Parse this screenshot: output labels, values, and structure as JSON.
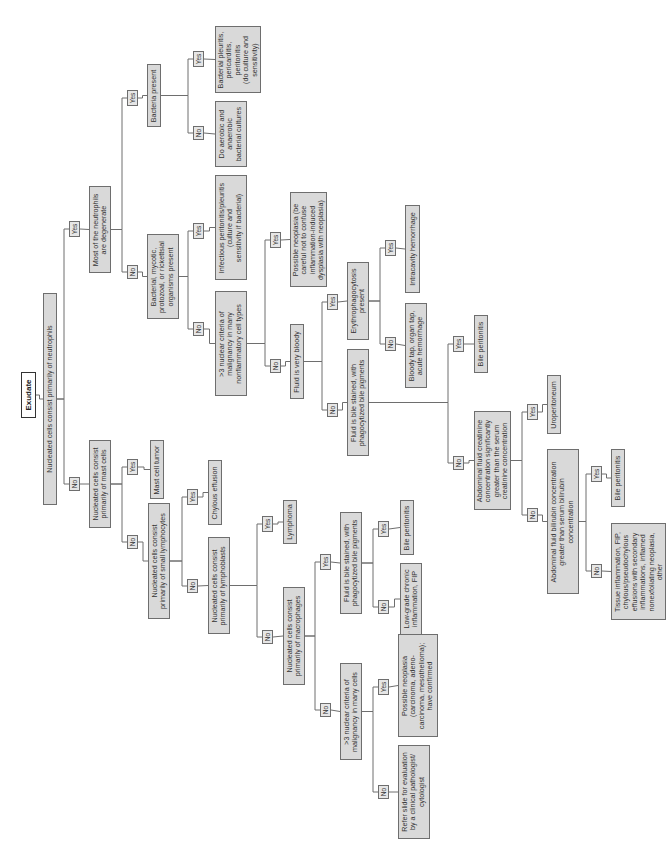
{
  "diagram": {
    "title": "Exudate",
    "orientation": "rotated -90deg (text reads bottom-to-top)",
    "line_color": "#6e6e6e",
    "box_fill": "#d9d9d9",
    "nodes": [
      {
        "id": "exudate",
        "kind": "root",
        "text": "Exudate",
        "x": 21,
        "y": 372,
        "w": 15,
        "h": 46
      },
      {
        "id": "neutrophils",
        "kind": "q",
        "text": "Nucleated cells consist primarily of neutrophils",
        "x": 43,
        "y": 293,
        "w": 14,
        "h": 212
      },
      {
        "id": "y_neut",
        "kind": "lbl",
        "text": "Yes",
        "x": 69,
        "y": 221,
        "w": 11,
        "h": 16
      },
      {
        "id": "degenerate",
        "kind": "q",
        "text": "Most of the neutrophils\nare degenerate",
        "x": 89,
        "y": 186,
        "w": 22,
        "h": 87
      },
      {
        "id": "y_degen",
        "kind": "lbl",
        "text": "Yes",
        "x": 127,
        "y": 90,
        "w": 11,
        "h": 16
      },
      {
        "id": "bacteria",
        "kind": "q",
        "text": "Bacteria present",
        "x": 147,
        "y": 64,
        "w": 14,
        "h": 63
      },
      {
        "id": "y_bact",
        "kind": "lbl",
        "text": "Yes",
        "x": 193,
        "y": 51,
        "w": 11,
        "h": 16
      },
      {
        "id": "bact_pleuritis",
        "kind": "r",
        "text": "Bacterial pleuritis,\npericarditis,\nperitonitis\n(do culture and\nsensitivity)",
        "x": 215,
        "y": 26,
        "w": 46,
        "h": 67
      },
      {
        "id": "n_bact",
        "kind": "lbl",
        "text": "No",
        "x": 193,
        "y": 126,
        "w": 11,
        "h": 14
      },
      {
        "id": "aerobic",
        "kind": "r",
        "text": "Do aerobic and\nanaerobic\nbacterial cultures",
        "x": 215,
        "y": 101,
        "w": 32,
        "h": 66
      },
      {
        "id": "n_degen",
        "kind": "lbl",
        "text": "No",
        "x": 127,
        "y": 265,
        "w": 11,
        "h": 14
      },
      {
        "id": "organisms",
        "kind": "q",
        "text": "Bacterial, mycotic,\nprotozoal, or rickettsial\norganisms present",
        "x": 147,
        "y": 234,
        "w": 32,
        "h": 85
      },
      {
        "id": "y_org",
        "kind": "lbl",
        "text": "Yes",
        "x": 193,
        "y": 223,
        "w": 11,
        "h": 16
      },
      {
        "id": "infectious",
        "kind": "r",
        "text": "Infectious peritonitis/pleuritis\n(culture and\nsensitivity if bacterial)",
        "x": 215,
        "y": 175,
        "w": 32,
        "h": 105
      },
      {
        "id": "n_org",
        "kind": "lbl",
        "text": "No",
        "x": 193,
        "y": 322,
        "w": 11,
        "h": 14
      },
      {
        "id": "malig_nonfl",
        "kind": "q",
        "text": ">3 nuclear criteria of\nmalignancy in many\nnonflammatory cell types",
        "x": 215,
        "y": 291,
        "w": 32,
        "h": 105
      },
      {
        "id": "y_malig1",
        "kind": "lbl",
        "text": "Yes",
        "x": 270,
        "y": 232,
        "w": 11,
        "h": 16
      },
      {
        "id": "poss_neo1",
        "kind": "r",
        "text": "Possible neoplasia (be\ncareful not to confuse\ninflammation-induced\ndysplasia with neoplasia)",
        "x": 290,
        "y": 192,
        "w": 37,
        "h": 95
      },
      {
        "id": "n_malig1",
        "kind": "lbl",
        "text": "No",
        "x": 270,
        "y": 359,
        "w": 11,
        "h": 14
      },
      {
        "id": "bloody",
        "kind": "q",
        "text": "Fluid is very bloody",
        "x": 290,
        "y": 324,
        "w": 14,
        "h": 75
      },
      {
        "id": "y_bloody",
        "kind": "lbl",
        "text": "Yes",
        "x": 327,
        "y": 294,
        "w": 11,
        "h": 16
      },
      {
        "id": "erythro",
        "kind": "q",
        "text": "Erythrophagocytosis\npresent",
        "x": 347,
        "y": 262,
        "w": 22,
        "h": 78
      },
      {
        "id": "y_erythro",
        "kind": "lbl",
        "text": "Yes",
        "x": 385,
        "y": 240,
        "w": 11,
        "h": 16
      },
      {
        "id": "intracavity",
        "kind": "r",
        "text": "Intracavity hemorrhage",
        "x": 405,
        "y": 205,
        "w": 15,
        "h": 88
      },
      {
        "id": "n_erythro",
        "kind": "lbl",
        "text": "No",
        "x": 385,
        "y": 337,
        "w": 11,
        "h": 14
      },
      {
        "id": "bloody_tap",
        "kind": "r",
        "text": "Bloody tap, organ tap,\nacute hemorrhage",
        "x": 405,
        "y": 303,
        "w": 22,
        "h": 85
      },
      {
        "id": "n_bloody",
        "kind": "lbl",
        "text": "No",
        "x": 327,
        "y": 403,
        "w": 11,
        "h": 14
      },
      {
        "id": "bile_stained1",
        "kind": "q",
        "text": "Fluid is bile stained, with\nphagocytized bile pigments",
        "x": 347,
        "y": 349,
        "w": 22,
        "h": 107
      },
      {
        "id": "y_bile1",
        "kind": "lbl",
        "text": "Yes",
        "x": 453,
        "y": 336,
        "w": 11,
        "h": 16
      },
      {
        "id": "bile_perit1",
        "kind": "r",
        "text": "Bile peritonitis",
        "x": 474,
        "y": 315,
        "w": 14,
        "h": 58
      },
      {
        "id": "n_bile1",
        "kind": "lbl",
        "text": "No",
        "x": 453,
        "y": 456,
        "w": 11,
        "h": 14
      },
      {
        "id": "creatinine",
        "kind": "q",
        "text": "Abdominal fluid creatinine\nconcentration significantly\ngreater than the serum\ncreatinine concentration",
        "x": 474,
        "y": 411,
        "w": 37,
        "h": 99
      },
      {
        "id": "y_creat",
        "kind": "lbl",
        "text": "Yes",
        "x": 527,
        "y": 404,
        "w": 11,
        "h": 16
      },
      {
        "id": "uroperit",
        "kind": "r",
        "text": "Uroperitoneum",
        "x": 547,
        "y": 375,
        "w": 14,
        "h": 59
      },
      {
        "id": "n_creat",
        "kind": "lbl",
        "text": "No",
        "x": 527,
        "y": 508,
        "w": 11,
        "h": 14
      },
      {
        "id": "bilirubin",
        "kind": "q",
        "text": "Abdominal fluid bilirubin concentration\ngreater than serum bilirubin\nconcentration",
        "x": 547,
        "y": 449,
        "w": 32,
        "h": 145
      },
      {
        "id": "y_bili",
        "kind": "lbl",
        "text": "Yes",
        "x": 591,
        "y": 466,
        "w": 11,
        "h": 16
      },
      {
        "id": "bile_perit2",
        "kind": "r",
        "text": "Bile peritonitis",
        "x": 611,
        "y": 449,
        "w": 14,
        "h": 58
      },
      {
        "id": "n_bili",
        "kind": "lbl",
        "text": "No",
        "x": 591,
        "y": 564,
        "w": 11,
        "h": 14
      },
      {
        "id": "tissue",
        "kind": "r",
        "text": "Tissue inflammation, FIP,\nchylous/pseudochylous\neffusions with secondary\ninflammations, inflamed\nnonexfoliating neoplasia,\nother",
        "x": 611,
        "y": 523,
        "w": 55,
        "h": 97
      },
      {
        "id": "n_neut",
        "kind": "lbl",
        "text": "No",
        "x": 69,
        "y": 477,
        "w": 11,
        "h": 14
      },
      {
        "id": "mast",
        "kind": "q",
        "text": "Nucleated cells consist\nprimarily of mast cells",
        "x": 89,
        "y": 440,
        "w": 22,
        "h": 88
      },
      {
        "id": "y_mast",
        "kind": "lbl",
        "text": "Yes",
        "x": 127,
        "y": 459,
        "w": 11,
        "h": 16
      },
      {
        "id": "mast_tumor",
        "kind": "r",
        "text": "Mast cell tumor",
        "x": 150,
        "y": 440,
        "w": 14,
        "h": 59
      },
      {
        "id": "n_mast",
        "kind": "lbl",
        "text": "No",
        "x": 127,
        "y": 535,
        "w": 11,
        "h": 14
      },
      {
        "id": "small_lymph",
        "kind": "q",
        "text": "Nucleated cells consist\nprimarily of small lymphocytes",
        "x": 148,
        "y": 503,
        "w": 22,
        "h": 116
      },
      {
        "id": "y_small",
        "kind": "lbl",
        "text": "Yes",
        "x": 187,
        "y": 489,
        "w": 11,
        "h": 16
      },
      {
        "id": "chylous",
        "kind": "r",
        "text": "Chylous effusion",
        "x": 208,
        "y": 460,
        "w": 14,
        "h": 65
      },
      {
        "id": "n_small",
        "kind": "lbl",
        "text": "No",
        "x": 187,
        "y": 579,
        "w": 11,
        "h": 14
      },
      {
        "id": "lymphoblasts",
        "kind": "q",
        "text": "Nucleated cells consist\nprimarily of lymphoblasts",
        "x": 208,
        "y": 537,
        "w": 22,
        "h": 97
      },
      {
        "id": "y_lymphob",
        "kind": "lbl",
        "text": "Yes",
        "x": 262,
        "y": 516,
        "w": 11,
        "h": 16
      },
      {
        "id": "lymphoma",
        "kind": "r",
        "text": "Lymphoma",
        "x": 283,
        "y": 500,
        "w": 14,
        "h": 44
      },
      {
        "id": "n_lymphob",
        "kind": "lbl",
        "text": "No",
        "x": 262,
        "y": 630,
        "w": 11,
        "h": 14
      },
      {
        "id": "macrophages",
        "kind": "q",
        "text": "Nucleated cells consist\nprimarily of macrophages",
        "x": 283,
        "y": 587,
        "w": 22,
        "h": 98
      },
      {
        "id": "y_macro",
        "kind": "lbl",
        "text": "Yes",
        "x": 320,
        "y": 554,
        "w": 11,
        "h": 16
      },
      {
        "id": "bile_stained2",
        "kind": "q",
        "text": "Fluid is bile stained, with\nphagocytized bile pigments",
        "x": 340,
        "y": 512,
        "w": 22,
        "h": 102
      },
      {
        "id": "y_bile2",
        "kind": "lbl",
        "text": "Yes",
        "x": 378,
        "y": 521,
        "w": 11,
        "h": 16
      },
      {
        "id": "bile_perit3",
        "kind": "r",
        "text": "Bile peritonitis",
        "x": 400,
        "y": 500,
        "w": 14,
        "h": 55
      },
      {
        "id": "n_bile2",
        "kind": "lbl",
        "text": "No",
        "x": 378,
        "y": 600,
        "w": 11,
        "h": 14
      },
      {
        "id": "lowgrade",
        "kind": "r",
        "text": "Low-grade chronic\ninflammation, FIP",
        "x": 400,
        "y": 563,
        "w": 22,
        "h": 72
      },
      {
        "id": "n_macro",
        "kind": "lbl",
        "text": "No",
        "x": 320,
        "y": 703,
        "w": 11,
        "h": 14
      },
      {
        "id": "malig_many",
        "kind": "q",
        "text": ">3 nuclear criteria of\nmalignancy in many cells",
        "x": 340,
        "y": 663,
        "w": 22,
        "h": 97
      },
      {
        "id": "y_malig2",
        "kind": "lbl",
        "text": "Yes",
        "x": 378,
        "y": 679,
        "w": 11,
        "h": 16
      },
      {
        "id": "poss_neo2",
        "kind": "r",
        "text": "Possible neoplasia\n(carcinoma, adeno-\ncarcinoma, mesothelioma);\nhave confirmed",
        "x": 398,
        "y": 634,
        "w": 40,
        "h": 103
      },
      {
        "id": "n_malig2",
        "kind": "lbl",
        "text": "No",
        "x": 378,
        "y": 785,
        "w": 11,
        "h": 14
      },
      {
        "id": "refer",
        "kind": "r",
        "text": "Refer slide for evaluation\nby a clinical pathologist/\ncytologist",
        "x": 398,
        "y": 745,
        "w": 32,
        "h": 94
      }
    ],
    "edges": [
      [
        "exudate",
        "neutrophils"
      ],
      [
        "neutrophils",
        "y_neut"
      ],
      [
        "y_neut",
        "degenerate"
      ],
      [
        "degenerate",
        "y_degen"
      ],
      [
        "y_degen",
        "bacteria"
      ],
      [
        "bacteria",
        "y_bact"
      ],
      [
        "y_bact",
        "bact_pleuritis"
      ],
      [
        "bacteria",
        "n_bact"
      ],
      [
        "n_bact",
        "aerobic"
      ],
      [
        "degenerate",
        "n_degen"
      ],
      [
        "n_degen",
        "organisms"
      ],
      [
        "organisms",
        "y_org"
      ],
      [
        "y_org",
        "infectious"
      ],
      [
        "organisms",
        "n_org"
      ],
      [
        "n_org",
        "malig_nonfl"
      ],
      [
        "malig_nonfl",
        "y_malig1"
      ],
      [
        "y_malig1",
        "poss_neo1"
      ],
      [
        "malig_nonfl",
        "n_malig1"
      ],
      [
        "n_malig1",
        "bloody"
      ],
      [
        "bloody",
        "y_bloody"
      ],
      [
        "y_bloody",
        "erythro"
      ],
      [
        "erythro",
        "y_erythro"
      ],
      [
        "y_erythro",
        "intracavity"
      ],
      [
        "erythro",
        "n_erythro"
      ],
      [
        "n_erythro",
        "bloody_tap"
      ],
      [
        "bloody",
        "n_bloody"
      ],
      [
        "n_bloody",
        "bile_stained1"
      ],
      [
        "bile_stained1",
        "y_bile1"
      ],
      [
        "y_bile1",
        "bile_perit1"
      ],
      [
        "bile_stained1",
        "n_bile1"
      ],
      [
        "n_bile1",
        "creatinine"
      ],
      [
        "creatinine",
        "y_creat"
      ],
      [
        "y_creat",
        "uroperit"
      ],
      [
        "creatinine",
        "n_creat"
      ],
      [
        "n_creat",
        "bilirubin"
      ],
      [
        "bilirubin",
        "y_bili"
      ],
      [
        "y_bili",
        "bile_perit2"
      ],
      [
        "bilirubin",
        "n_bili"
      ],
      [
        "n_bili",
        "tissue"
      ],
      [
        "neutrophils",
        "n_neut"
      ],
      [
        "n_neut",
        "mast"
      ],
      [
        "mast",
        "y_mast"
      ],
      [
        "y_mast",
        "mast_tumor"
      ],
      [
        "mast",
        "n_mast"
      ],
      [
        "n_mast",
        "small_lymph"
      ],
      [
        "small_lymph",
        "y_small"
      ],
      [
        "y_small",
        "chylous"
      ],
      [
        "small_lymph",
        "n_small"
      ],
      [
        "n_small",
        "lymphoblasts"
      ],
      [
        "lymphoblasts",
        "y_lymphob"
      ],
      [
        "y_lymphob",
        "lymphoma"
      ],
      [
        "lymphoblasts",
        "n_lymphob"
      ],
      [
        "n_lymphob",
        "macrophages"
      ],
      [
        "macrophages",
        "y_macro"
      ],
      [
        "y_macro",
        "bile_stained2"
      ],
      [
        "bile_stained2",
        "y_bile2"
      ],
      [
        "y_bile2",
        "bile_perit3"
      ],
      [
        "bile_stained2",
        "n_bile2"
      ],
      [
        "n_bile2",
        "lowgrade"
      ],
      [
        "macrophages",
        "n_macro"
      ],
      [
        "n_macro",
        "malig_many"
      ],
      [
        "malig_many",
        "y_malig2"
      ],
      [
        "y_malig2",
        "poss_neo2"
      ],
      [
        "malig_many",
        "n_malig2"
      ],
      [
        "n_malig2",
        "refer"
      ]
    ]
  }
}
